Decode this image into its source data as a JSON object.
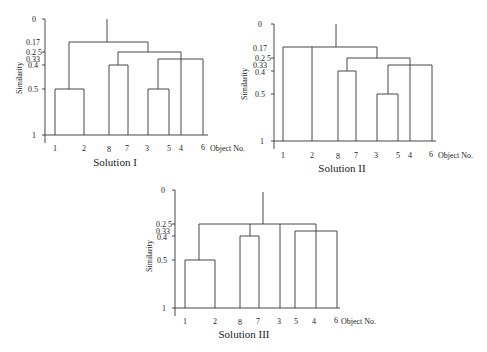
{
  "figure": {
    "y_axis_label": "Similarity",
    "x_axis_label": "Object No.",
    "panels": [
      {
        "title": "Solution I",
        "leaves": [
          "1",
          "2",
          "8",
          "7",
          "3",
          "5",
          "4",
          "6"
        ],
        "y_ticks": [
          "0",
          "0.17",
          "0.2 5",
          "0.33",
          "0.4",
          "0.5",
          "1"
        ],
        "merges": [
          {
            "members": [
              "1",
              "2"
            ],
            "similarity": 0.5
          },
          {
            "members": [
              "8",
              "7"
            ],
            "similarity": 0.4
          },
          {
            "members": [
              "3",
              "5"
            ],
            "similarity": 0.5
          },
          {
            "members": [
              "3,5",
              "6"
            ],
            "similarity": 0.33
          },
          {
            "members": [
              "8,7",
              "4"
            ],
            "similarity": 0.25
          },
          {
            "members": [
              "1,2",
              "8,7,4,3,5,6"
            ],
            "similarity": 0.17
          }
        ]
      },
      {
        "title": "Solution II",
        "leaves": [
          "1",
          "2",
          "8",
          "7",
          "3",
          "5",
          "4",
          "6"
        ],
        "y_ticks": [
          "0",
          "0.17",
          "0.2 5",
          "0.33",
          "0.4",
          "0.5",
          "1"
        ],
        "merges": [
          {
            "members": [
              "8",
              "7"
            ],
            "similarity": 0.4
          },
          {
            "members": [
              "3",
              "5"
            ],
            "similarity": 0.5
          },
          {
            "members": [
              "3,5",
              "6"
            ],
            "similarity": 0.33
          },
          {
            "members": [
              "8,7",
              "4"
            ],
            "similarity": 0.25
          },
          {
            "members": [
              "1",
              "2",
              "8,7,4,3,5,6"
            ],
            "similarity": 0.17
          }
        ]
      },
      {
        "title": "Solution III",
        "leaves": [
          "1",
          "2",
          "8",
          "7",
          "3",
          "5",
          "4",
          "6"
        ],
        "y_ticks": [
          "0",
          "0.2 5",
          "0.33",
          "0.4",
          "0.5",
          "1"
        ],
        "merges": [
          {
            "members": [
              "1",
              "2"
            ],
            "similarity": 0.5
          },
          {
            "members": [
              "8",
              "7"
            ],
            "similarity": 0.4
          },
          {
            "members": [
              "5",
              "6"
            ],
            "similarity": 0.33
          },
          {
            "members": [
              "1,2",
              "8,7",
              "3",
              "4",
              "5,6"
            ],
            "similarity": 0.25
          }
        ]
      }
    ]
  }
}
